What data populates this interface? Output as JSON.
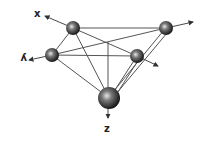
{
  "diagram": {
    "type": "molecular-geometry",
    "colors": {
      "background": "#ffffff",
      "bond": "#555555",
      "sphere_dark": "#111111",
      "sphere_light": "#dddddd",
      "arrow": "#333333"
    },
    "axes": [
      {
        "id": "x",
        "label": "x"
      },
      {
        "id": "y",
        "label": "y"
      },
      {
        "id": "z",
        "label": "z"
      }
    ],
    "atoms": [
      {
        "id": "top-left",
        "cx": 73,
        "cy": 28,
        "r": 7
      },
      {
        "id": "top-right",
        "cx": 166,
        "cy": 28,
        "r": 7
      },
      {
        "id": "left",
        "cx": 52,
        "cy": 55,
        "r": 7
      },
      {
        "id": "right-middle",
        "cx": 137,
        "cy": 56,
        "r": 7
      },
      {
        "id": "bottom",
        "cx": 109,
        "cy": 98,
        "r": 11
      }
    ]
  }
}
